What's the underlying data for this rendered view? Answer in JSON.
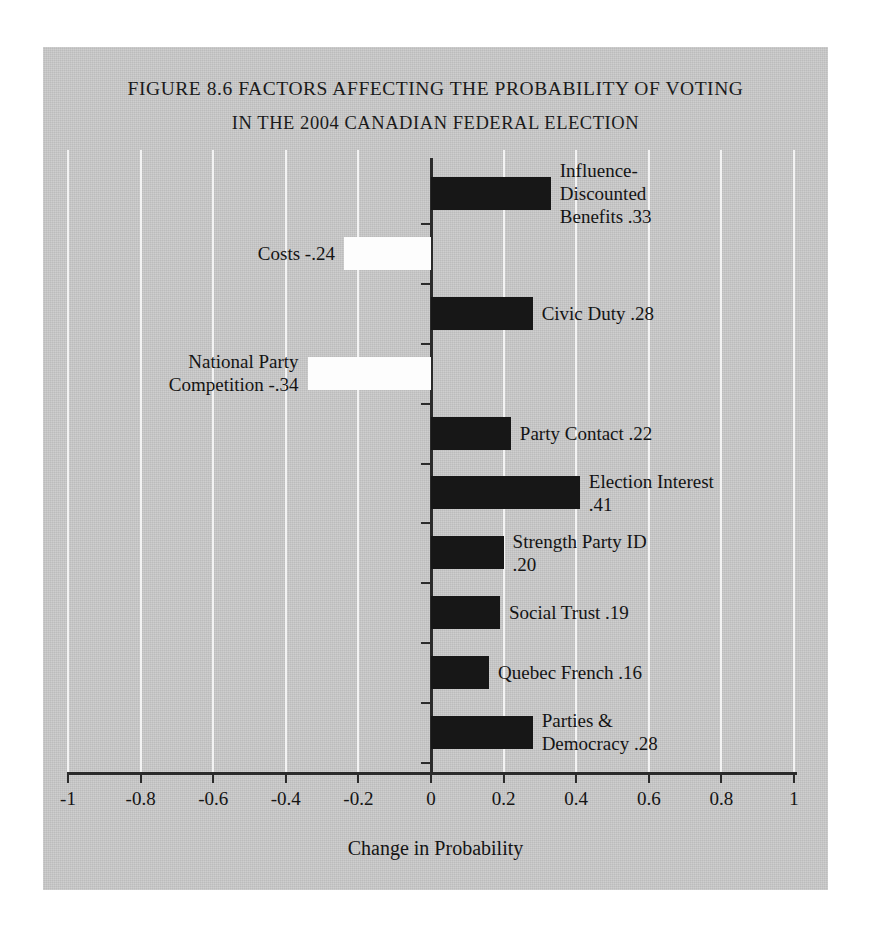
{
  "figure": {
    "title_line1": "Figure 8.6 Factors Affecting the Probability of Voting",
    "title_line2": "in the 2004 Canadian Federal Election"
  },
  "chart_data": {
    "type": "bar",
    "orientation": "horizontal",
    "title": "Figure 8.6 Factors Affecting the Probability of Voting in the 2004 Canadian Federal Election",
    "xlabel": "Change in Probability",
    "ylabel": "",
    "xlim": [
      -1,
      1
    ],
    "grid": true,
    "legend": "none",
    "xticks": [
      -1,
      -0.8,
      -0.6,
      -0.4,
      -0.2,
      0,
      0.2,
      0.4,
      0.6,
      0.8,
      1
    ],
    "xticklabels": [
      "-1",
      "-0.8",
      "-0.6",
      "-0.4",
      "-0.2",
      "0",
      "0.2",
      "0.4",
      "0.6",
      "0.8",
      "1"
    ],
    "categories": [
      "Influence-Discounted Benefits",
      "Costs",
      "Civic Duty",
      "National Party Competition",
      "Party Contact",
      "Election Interest",
      "Strength Party ID",
      "Social Trust",
      "Quebec French",
      "Parties & Democracy"
    ],
    "values": [
      0.33,
      -0.24,
      0.28,
      -0.34,
      0.22,
      0.41,
      0.2,
      0.19,
      0.16,
      0.28
    ],
    "bars": [
      {
        "category": "Influence-Discounted Benefits",
        "value": 0.33,
        "value_label": ".33",
        "label": "Influence-\nDiscounted\nBenefits .33",
        "side": "right",
        "fill": "black"
      },
      {
        "category": "Costs",
        "value": -0.24,
        "value_label": "-.24",
        "label": "Costs -.24",
        "side": "left",
        "fill": "white"
      },
      {
        "category": "Civic Duty",
        "value": 0.28,
        "value_label": ".28",
        "label": "Civic Duty .28",
        "side": "right",
        "fill": "black"
      },
      {
        "category": "National Party Competition",
        "value": -0.34,
        "value_label": "-.34",
        "label": "National Party\nCompetition -.34",
        "side": "left",
        "fill": "white"
      },
      {
        "category": "Party Contact",
        "value": 0.22,
        "value_label": ".22",
        "label": "Party Contact .22",
        "side": "right",
        "fill": "black"
      },
      {
        "category": "Election Interest",
        "value": 0.41,
        "value_label": ".41",
        "label": "Election Interest\n.41",
        "side": "right",
        "fill": "black"
      },
      {
        "category": "Strength Party ID",
        "value": 0.2,
        "value_label": ".20",
        "label": "Strength Party ID\n.20",
        "side": "right",
        "fill": "black"
      },
      {
        "category": "Social Trust",
        "value": 0.19,
        "value_label": ".19",
        "label": "Social Trust .19",
        "side": "right",
        "fill": "black"
      },
      {
        "category": "Quebec French",
        "value": 0.16,
        "value_label": ".16",
        "label": "Quebec French .16",
        "side": "right",
        "fill": "black"
      },
      {
        "category": "Parties & Democracy",
        "value": 0.28,
        "value_label": ".28",
        "label": "Parties &\nDemocracy .28",
        "side": "right",
        "fill": "black"
      }
    ],
    "colors": {
      "panel_background": "#c9c9c9",
      "positive_bar": "#171717",
      "negative_bar": "#fdfdfd",
      "axis": "#2b2b2b",
      "gridline": "#f3f3f3",
      "text": "#141414"
    }
  }
}
